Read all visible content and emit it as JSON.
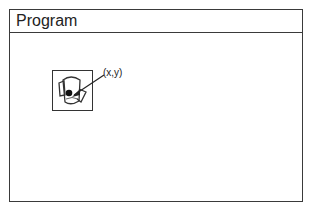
{
  "window": {
    "title": "Program"
  },
  "canvas": {
    "icon": "cursor-drag-icon",
    "hotspot_label": "(x,y)"
  }
}
